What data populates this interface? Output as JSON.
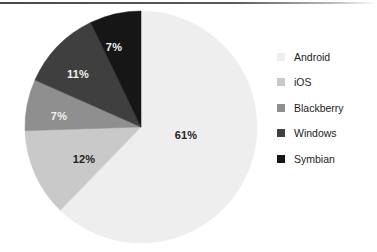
{
  "figure": {
    "background_color": "#ffffff",
    "top_rule_color": "#4a4a4a"
  },
  "chart_data": {
    "type": "pie",
    "title": "",
    "subtitle": "",
    "xlabel": "",
    "ylabel": "",
    "grid": false,
    "legend_position": "right",
    "start_angle_deg": 0,
    "direction": "clockwise",
    "units": "percent",
    "total": 98,
    "categories": [
      "Android",
      "iOS",
      "Blackberry",
      "Windows",
      "Symbian"
    ],
    "values": [
      61,
      12,
      7,
      11,
      7
    ],
    "labels": [
      "61%",
      "12%",
      "7%",
      "11%",
      "7%"
    ],
    "colors": [
      "#eeeeee",
      "#c9c9c9",
      "#8f8f8f",
      "#3f3f3f",
      "#161616"
    ],
    "slices": [
      {
        "name": "Android",
        "value": 61,
        "label": "61%",
        "color": "#eeeeee",
        "label_color": "#242424",
        "label_x": 186,
        "label_y": 135
      },
      {
        "name": "iOS",
        "value": 12,
        "label": "12%",
        "color": "#c9c9c9",
        "label_color": "#242424",
        "label_x": 84,
        "label_y": 159
      },
      {
        "name": "Blackberry",
        "value": 7,
        "label": "7%",
        "color": "#8f8f8f",
        "label_color": "#f2f2f2",
        "label_x": 59,
        "label_y": 116
      },
      {
        "name": "Windows",
        "value": 11,
        "label": "11%",
        "color": "#3f3f3f",
        "label_color": "#f2f2f2",
        "label_x": 78,
        "label_y": 74
      },
      {
        "name": "Symbian",
        "value": 7,
        "label": "7%",
        "color": "#161616",
        "label_color": "#f2f2f2",
        "label_x": 114,
        "label_y": 47
      }
    ]
  },
  "legend": {
    "items": [
      {
        "label": "Android",
        "color": "#eeeeee"
      },
      {
        "label": "iOS",
        "color": "#c9c9c9"
      },
      {
        "label": "Blackberry",
        "color": "#8f8f8f"
      },
      {
        "label": "Windows",
        "color": "#3f3f3f"
      },
      {
        "label": "Symbian",
        "color": "#161616"
      }
    ]
  }
}
